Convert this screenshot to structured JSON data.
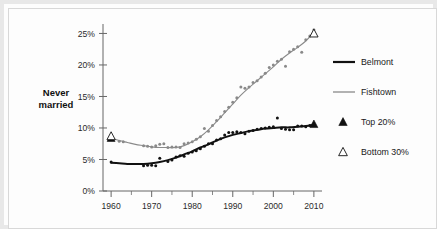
{
  "chart_data": {
    "type": "line",
    "title": "",
    "xlabel": "",
    "ylabel": "Never married",
    "ylabel_line1": "Never",
    "ylabel_line2": "married",
    "xlim": [
      1958,
      2012
    ],
    "ylim": [
      0,
      26.5
    ],
    "grid": false,
    "legend_position": "right",
    "y_tick_labels": [
      "0%",
      "5%",
      "10%",
      "15%",
      "20%",
      "25%"
    ],
    "y_tick_values": [
      0,
      5,
      10,
      15,
      20,
      25
    ],
    "x_tick_labels": [
      "1960",
      "1970",
      "1980",
      "1990",
      "2000",
      "2010"
    ],
    "x_tick_values": [
      1960,
      1970,
      1980,
      1990,
      2000,
      2010
    ],
    "x_minor_ticks": [
      1965,
      1975,
      1985,
      1995,
      2005
    ],
    "series": [
      {
        "name": "Belmont",
        "style": "line-thick-black",
        "color": "#111111",
        "marker": "dot",
        "trend": [
          {
            "x": 1960,
            "y": 4.5
          },
          {
            "x": 1962,
            "y": 4.4
          },
          {
            "x": 1964,
            "y": 4.3
          },
          {
            "x": 1966,
            "y": 4.3
          },
          {
            "x": 1968,
            "y": 4.3
          },
          {
            "x": 1970,
            "y": 4.4
          },
          {
            "x": 1972,
            "y": 4.6
          },
          {
            "x": 1974,
            "y": 4.9
          },
          {
            "x": 1976,
            "y": 5.3
          },
          {
            "x": 1978,
            "y": 5.8
          },
          {
            "x": 1980,
            "y": 6.3
          },
          {
            "x": 1982,
            "y": 6.9
          },
          {
            "x": 1984,
            "y": 7.4
          },
          {
            "x": 1986,
            "y": 8.0
          },
          {
            "x": 1988,
            "y": 8.5
          },
          {
            "x": 1990,
            "y": 8.9
          },
          {
            "x": 1992,
            "y": 9.2
          },
          {
            "x": 1994,
            "y": 9.5
          },
          {
            "x": 1996,
            "y": 9.7
          },
          {
            "x": 1998,
            "y": 9.9
          },
          {
            "x": 2000,
            "y": 10.0
          },
          {
            "x": 2002,
            "y": 10.1
          },
          {
            "x": 2004,
            "y": 10.1
          },
          {
            "x": 2006,
            "y": 10.2
          },
          {
            "x": 2008,
            "y": 10.3
          },
          {
            "x": 2010,
            "y": 10.5
          }
        ],
        "points": [
          {
            "x": 1960,
            "y": 4.6
          },
          {
            "x": 1968,
            "y": 4.0
          },
          {
            "x": 1969,
            "y": 4.1
          },
          {
            "x": 1970,
            "y": 4.1
          },
          {
            "x": 1971,
            "y": 4.0
          },
          {
            "x": 1972,
            "y": 5.2
          },
          {
            "x": 1974,
            "y": 4.7
          },
          {
            "x": 1975,
            "y": 4.9
          },
          {
            "x": 1976,
            "y": 5.4
          },
          {
            "x": 1977,
            "y": 5.6
          },
          {
            "x": 1978,
            "y": 5.5
          },
          {
            "x": 1979,
            "y": 6.0
          },
          {
            "x": 1980,
            "y": 6.2
          },
          {
            "x": 1981,
            "y": 6.4
          },
          {
            "x": 1982,
            "y": 6.7
          },
          {
            "x": 1983,
            "y": 7.1
          },
          {
            "x": 1984,
            "y": 7.5
          },
          {
            "x": 1985,
            "y": 7.5
          },
          {
            "x": 1986,
            "y": 8.1
          },
          {
            "x": 1987,
            "y": 8.3
          },
          {
            "x": 1988,
            "y": 8.9
          },
          {
            "x": 1989,
            "y": 9.3
          },
          {
            "x": 1990,
            "y": 9.3
          },
          {
            "x": 1991,
            "y": 9.4
          },
          {
            "x": 1992,
            "y": 9.3
          },
          {
            "x": 1993,
            "y": 9.1
          },
          {
            "x": 1994,
            "y": 9.5
          },
          {
            "x": 1995,
            "y": 9.6
          },
          {
            "x": 1996,
            "y": 9.8
          },
          {
            "x": 1997,
            "y": 9.9
          },
          {
            "x": 1998,
            "y": 10.0
          },
          {
            "x": 1999,
            "y": 10.1
          },
          {
            "x": 2000,
            "y": 10.2
          },
          {
            "x": 2001,
            "y": 11.6
          },
          {
            "x": 2002,
            "y": 9.9
          },
          {
            "x": 2003,
            "y": 9.8
          },
          {
            "x": 2004,
            "y": 9.7
          },
          {
            "x": 2005,
            "y": 9.7
          },
          {
            "x": 2006,
            "y": 10.3
          },
          {
            "x": 2007,
            "y": 10.3
          },
          {
            "x": 2008,
            "y": 10.2
          },
          {
            "x": 2009,
            "y": 10.4
          },
          {
            "x": 2010,
            "y": 10.6
          }
        ],
        "top20_marker": [
          {
            "x": 1960,
            "y": 8.4
          },
          {
            "x": 2010,
            "y": 10.6
          }
        ]
      },
      {
        "name": "Fishtown",
        "style": "line-thin-gray",
        "color": "#8a8a8a",
        "marker": "dot",
        "trend": [
          {
            "x": 1960,
            "y": 8.4
          },
          {
            "x": 1962,
            "y": 8.0
          },
          {
            "x": 1964,
            "y": 7.7
          },
          {
            "x": 1966,
            "y": 7.4
          },
          {
            "x": 1968,
            "y": 7.2
          },
          {
            "x": 1970,
            "y": 7.0
          },
          {
            "x": 1972,
            "y": 6.9
          },
          {
            "x": 1974,
            "y": 6.9
          },
          {
            "x": 1976,
            "y": 6.9
          },
          {
            "x": 1978,
            "y": 7.2
          },
          {
            "x": 1980,
            "y": 7.8
          },
          {
            "x": 1982,
            "y": 8.6
          },
          {
            "x": 1984,
            "y": 9.7
          },
          {
            "x": 1986,
            "y": 11.0
          },
          {
            "x": 1988,
            "y": 12.4
          },
          {
            "x": 1990,
            "y": 13.8
          },
          {
            "x": 1992,
            "y": 15.2
          },
          {
            "x": 1994,
            "y": 16.4
          },
          {
            "x": 1996,
            "y": 17.5
          },
          {
            "x": 1998,
            "y": 18.6
          },
          {
            "x": 2000,
            "y": 19.7
          },
          {
            "x": 2002,
            "y": 20.9
          },
          {
            "x": 2004,
            "y": 21.9
          },
          {
            "x": 2006,
            "y": 22.8
          },
          {
            "x": 2008,
            "y": 23.8
          },
          {
            "x": 2010,
            "y": 25.2
          }
        ],
        "points": [
          {
            "x": 1960,
            "y": 8.5
          },
          {
            "x": 1962,
            "y": 7.9
          },
          {
            "x": 1963,
            "y": 7.8
          },
          {
            "x": 1968,
            "y": 7.2
          },
          {
            "x": 1969,
            "y": 7.1
          },
          {
            "x": 1970,
            "y": 7.0
          },
          {
            "x": 1971,
            "y": 7.2
          },
          {
            "x": 1972,
            "y": 7.4
          },
          {
            "x": 1973,
            "y": 7.5
          },
          {
            "x": 1974,
            "y": 6.9
          },
          {
            "x": 1975,
            "y": 7.0
          },
          {
            "x": 1976,
            "y": 7.0
          },
          {
            "x": 1977,
            "y": 6.9
          },
          {
            "x": 1978,
            "y": 7.5
          },
          {
            "x": 1979,
            "y": 7.6
          },
          {
            "x": 1980,
            "y": 7.8
          },
          {
            "x": 1981,
            "y": 8.2
          },
          {
            "x": 1982,
            "y": 8.6
          },
          {
            "x": 1983,
            "y": 9.9
          },
          {
            "x": 1984,
            "y": 9.5
          },
          {
            "x": 1985,
            "y": 10.4
          },
          {
            "x": 1986,
            "y": 11.2
          },
          {
            "x": 1987,
            "y": 11.8
          },
          {
            "x": 1988,
            "y": 12.6
          },
          {
            "x": 1989,
            "y": 13.3
          },
          {
            "x": 1990,
            "y": 14.1
          },
          {
            "x": 1991,
            "y": 14.8
          },
          {
            "x": 1992,
            "y": 16.5
          },
          {
            "x": 1993,
            "y": 16.3
          },
          {
            "x": 1994,
            "y": 16.5
          },
          {
            "x": 1995,
            "y": 17.2
          },
          {
            "x": 1996,
            "y": 17.5
          },
          {
            "x": 1997,
            "y": 18.1
          },
          {
            "x": 1998,
            "y": 18.7
          },
          {
            "x": 1999,
            "y": 19.6
          },
          {
            "x": 2000,
            "y": 20.0
          },
          {
            "x": 2001,
            "y": 20.6
          },
          {
            "x": 2002,
            "y": 20.9
          },
          {
            "x": 2003,
            "y": 19.8
          },
          {
            "x": 2004,
            "y": 22.1
          },
          {
            "x": 2005,
            "y": 22.5
          },
          {
            "x": 2006,
            "y": 22.9
          },
          {
            "x": 2007,
            "y": 22.0
          },
          {
            "x": 2008,
            "y": 24.0
          },
          {
            "x": 2009,
            "y": 24.6
          },
          {
            "x": 2010,
            "y": 25.6
          }
        ],
        "bottom30_marker": [
          {
            "x": 1960,
            "y": 8.7
          },
          {
            "x": 2010,
            "y": 25.0
          }
        ]
      }
    ]
  },
  "legend": {
    "items": [
      {
        "label": "Belmont",
        "kind": "line",
        "color": "#111111"
      },
      {
        "label": "Fishtown",
        "kind": "line",
        "color": "#8a8a8a"
      },
      {
        "label": "Top 20%",
        "kind": "triangle-filled",
        "color": "#111111"
      },
      {
        "label": "Bottom 30%",
        "kind": "triangle-open",
        "color": "#111111"
      }
    ]
  },
  "colors": {
    "belmont": "#111111",
    "fishtown": "#8a8a8a",
    "axis": "#555555",
    "text": "#1a1a1a",
    "frame": "#e8e8e8",
    "background": "#fdfdfd"
  }
}
